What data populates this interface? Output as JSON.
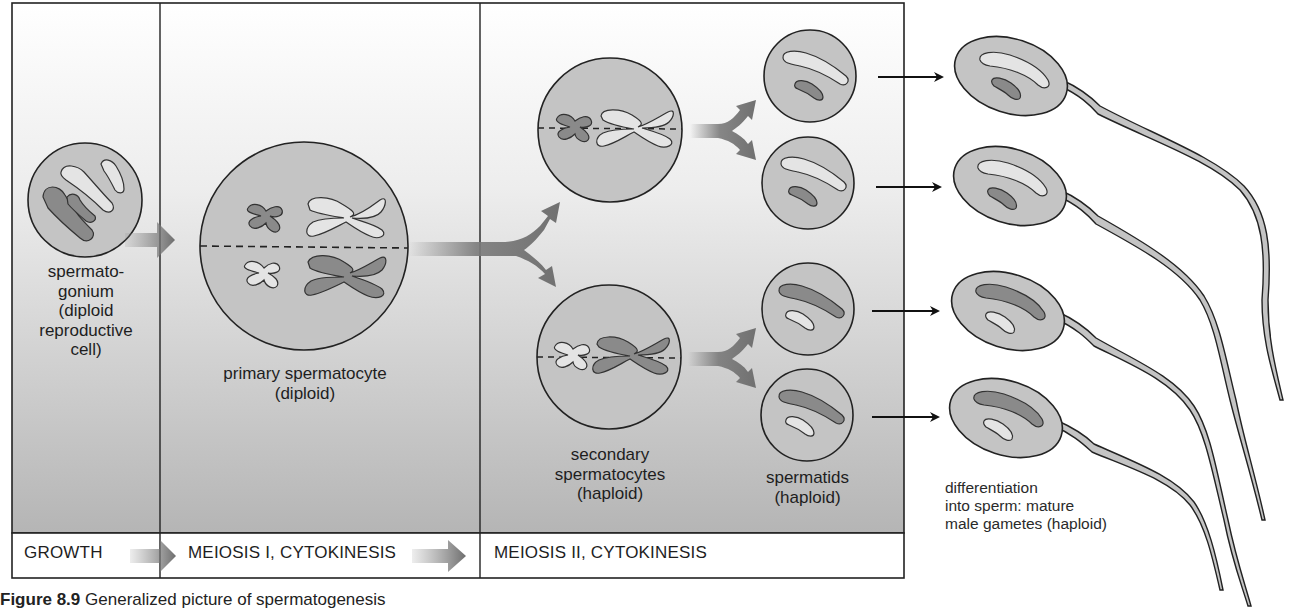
{
  "figure": {
    "caption_prefix": "Figure 8.9",
    "caption_text": "Generalized picture of spermatogenesis"
  },
  "cells": {
    "spermatogonium": {
      "label": "spermato-\ngonium\n(diploid\nreproductive\ncell)"
    },
    "primary_spermatocyte": {
      "label": "primary spermatocyte\n(diploid)"
    },
    "secondary_spermatocytes": {
      "label": "secondary\nspermatocytes\n(haploid)"
    },
    "spermatids": {
      "label": "spermatids\n(haploid)"
    },
    "sperm": {
      "label": "differentiation\ninto sperm: mature\nmale gametes (haploid)"
    }
  },
  "stages": [
    {
      "label": "GROWTH"
    },
    {
      "label": "MEIOSIS I, CYTOKINESIS"
    },
    {
      "label": "MEIOSIS II, CYTOKINESIS"
    }
  ],
  "colors": {
    "cell_fill": "#c4c4c4",
    "dark_chromosome": "#8a8a8a",
    "light_chromosome": "#e4e4e4",
    "arrow_gray": "#7a7a7a",
    "outline": "#2a2a2a",
    "panel_gradient_top": "#ffffff",
    "panel_gradient_bottom": "#b8b8b8"
  }
}
